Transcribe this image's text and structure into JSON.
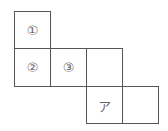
{
  "diagram": {
    "type": "cube-net",
    "cells": [
      {
        "row": 0,
        "col": 0,
        "label": "①"
      },
      {
        "row": 1,
        "col": 0,
        "label": "②"
      },
      {
        "row": 1,
        "col": 1,
        "label": "③"
      },
      {
        "row": 1,
        "col": 2,
        "label": ""
      },
      {
        "row": 2,
        "col": 2,
        "label": "ア"
      },
      {
        "row": 2,
        "col": 3,
        "label": ""
      }
    ],
    "line_color": "#555555"
  }
}
